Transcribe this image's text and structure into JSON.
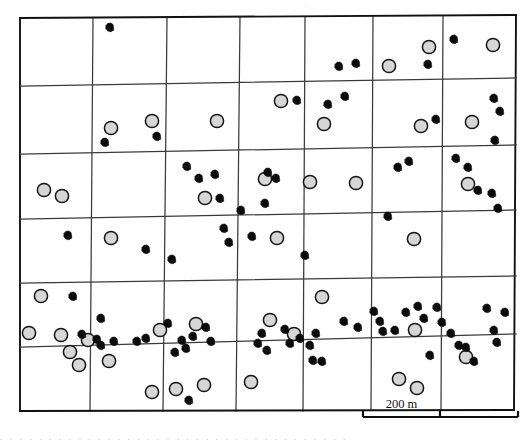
{
  "figure": {
    "type": "scatter-map",
    "title": "",
    "width": 532,
    "height": 442,
    "background_color": "#ffffff",
    "top_artifact_text": "···",
    "bottom_artifact_text": ". . .  . . .  .  . .  . .  . .  .  .  .  .  . .  .  . . .  . . . .  . .  . .  . . . . ."
  },
  "scalebar": {
    "label": "200 m",
    "value": 200,
    "unit": "m",
    "x_start": 363,
    "x_end": 518,
    "y": 417,
    "tick_positions": [
      363,
      440,
      518
    ],
    "color": "#0d0d0d"
  },
  "legend": {
    "series": [
      {
        "name": "open-circle",
        "label": "",
        "fill": "#d6d6d6",
        "stroke": "#151515",
        "radius": 6.6
      },
      {
        "name": "filled-blob",
        "label": "",
        "fill": "#0b0b0b",
        "stroke": "#0b0b0b",
        "radius": 4.4
      }
    ]
  },
  "chart_data": {
    "type": "scatter",
    "title": "",
    "xlabel": "",
    "ylabel": "",
    "xlim": [
      0,
      532
    ],
    "ylim": [
      0,
      442
    ],
    "grid": true,
    "legend_position": "none",
    "grid_lines": {
      "vertical": [
        {
          "x_top": 20,
          "y_top": 18,
          "x_bottom": 20,
          "y_bottom": 411
        },
        {
          "x_top": 93,
          "y_top": 18,
          "x_bottom": 90,
          "y_bottom": 411
        },
        {
          "x_top": 167,
          "y_top": 18,
          "x_bottom": 163,
          "y_bottom": 411
        },
        {
          "x_top": 240,
          "y_top": 17,
          "x_bottom": 236,
          "y_bottom": 411
        },
        {
          "x_top": 305,
          "y_top": 17,
          "x_bottom": 303,
          "y_bottom": 411
        },
        {
          "x_top": 373,
          "y_top": 16,
          "x_bottom": 371,
          "y_bottom": 410
        },
        {
          "x_top": 443,
          "y_top": 16,
          "x_bottom": 441,
          "y_bottom": 410
        },
        {
          "x_top": 516,
          "y_top": 15,
          "x_bottom": 514,
          "y_bottom": 410
        }
      ],
      "horizontal": [
        {
          "x_left": 20,
          "y_left": 18,
          "x_right": 516,
          "y_right": 15
        },
        {
          "x_left": 20,
          "y_left": 86,
          "x_right": 516,
          "y_right": 78
        },
        {
          "x_left": 20,
          "y_left": 154,
          "x_right": 516,
          "y_right": 145
        },
        {
          "x_left": 20,
          "y_left": 219,
          "x_right": 516,
          "y_right": 210
        },
        {
          "x_left": 20,
          "y_left": 283,
          "x_right": 516,
          "y_right": 276
        },
        {
          "x_left": 20,
          "y_left": 347,
          "x_right": 516,
          "y_right": 334
        },
        {
          "x_left": 20,
          "y_left": 411,
          "x_right": 514,
          "y_right": 410
        }
      ]
    },
    "series": [
      {
        "name": "open-circle",
        "marker": "circle-open",
        "fill": "#d6d6d6",
        "stroke": "#151515",
        "radius": 6.6,
        "count": 40,
        "points": [
          [
            111,
            128
          ],
          [
            152,
            121
          ],
          [
            217,
            121
          ],
          [
            281,
            101
          ],
          [
            324,
            124
          ],
          [
            389,
            66
          ],
          [
            429,
            47
          ],
          [
            493,
            45
          ],
          [
            421,
            126
          ],
          [
            472,
            122
          ],
          [
            44,
            190
          ],
          [
            205,
            198
          ],
          [
            265,
            179
          ],
          [
            310,
            182
          ],
          [
            356,
            183
          ],
          [
            468,
            184
          ],
          [
            111,
            238
          ],
          [
            277,
            238
          ],
          [
            414,
            239
          ],
          [
            41,
            296
          ],
          [
            322,
            297
          ],
          [
            29,
            333
          ],
          [
            61,
            335
          ],
          [
            88,
            340
          ],
          [
            160,
            330
          ],
          [
            196,
            324
          ],
          [
            270,
            320
          ],
          [
            294,
            334
          ],
          [
            415,
            330
          ],
          [
            466,
            357
          ],
          [
            70,
            352
          ],
          [
            79,
            365
          ],
          [
            109,
            361
          ],
          [
            152,
            392
          ],
          [
            176,
            389
          ],
          [
            204,
            385
          ],
          [
            251,
            382
          ],
          [
            399,
            379
          ],
          [
            417,
            388
          ],
          [
            62,
            196
          ]
        ]
      },
      {
        "name": "filled-blob",
        "marker": "blob-filled",
        "fill": "#0b0b0b",
        "stroke": "#0b0b0b",
        "radius": 4.4,
        "count": 82,
        "points": [
          [
            110,
            27
          ],
          [
            339,
            66
          ],
          [
            345,
            96
          ],
          [
            356,
            63
          ],
          [
            428,
            64
          ],
          [
            454,
            39
          ],
          [
            297,
            100
          ],
          [
            328,
            104
          ],
          [
            436,
            119
          ],
          [
            494,
            98
          ],
          [
            500,
            111
          ],
          [
            495,
            140
          ],
          [
            105,
            142
          ],
          [
            157,
            136
          ],
          [
            187,
            166
          ],
          [
            199,
            178
          ],
          [
            215,
            174
          ],
          [
            220,
            198
          ],
          [
            241,
            210
          ],
          [
            268,
            172
          ],
          [
            276,
            178
          ],
          [
            265,
            203
          ],
          [
            398,
            167
          ],
          [
            409,
            161
          ],
          [
            456,
            158
          ],
          [
            468,
            167
          ],
          [
            478,
            190
          ],
          [
            492,
            193
          ],
          [
            498,
            208
          ],
          [
            68,
            235
          ],
          [
            146,
            249
          ],
          [
            172,
            259
          ],
          [
            224,
            228
          ],
          [
            229,
            242
          ],
          [
            252,
            236
          ],
          [
            305,
            255
          ],
          [
            388,
            216
          ],
          [
            73,
            296
          ],
          [
            101,
            318
          ],
          [
            82,
            334
          ],
          [
            97,
            339
          ],
          [
            114,
            341
          ],
          [
            137,
            341
          ],
          [
            146,
            338
          ],
          [
            168,
            323
          ],
          [
            182,
            340
          ],
          [
            193,
            336
          ],
          [
            206,
            327
          ],
          [
            211,
            341
          ],
          [
            175,
            352
          ],
          [
            186,
            348
          ],
          [
            101,
            345
          ],
          [
            258,
            343
          ],
          [
            262,
            333
          ],
          [
            267,
            350
          ],
          [
            285,
            329
          ],
          [
            290,
            343
          ],
          [
            300,
            338
          ],
          [
            310,
            345
          ],
          [
            316,
            333
          ],
          [
            344,
            321
          ],
          [
            358,
            327
          ],
          [
            374,
            311
          ],
          [
            380,
            321
          ],
          [
            383,
            331
          ],
          [
            395,
            330
          ],
          [
            406,
            312
          ],
          [
            418,
            306
          ],
          [
            424,
            318
          ],
          [
            437,
            307
          ],
          [
            442,
            322
          ],
          [
            451,
            333
          ],
          [
            459,
            345
          ],
          [
            487,
            308
          ],
          [
            494,
            330
          ],
          [
            497,
            342
          ],
          [
            505,
            312
          ],
          [
            430,
            355
          ],
          [
            466,
            347
          ],
          [
            474,
            361
          ],
          [
            313,
            360
          ],
          [
            322,
            361
          ],
          [
            189,
            400
          ]
        ]
      }
    ]
  }
}
